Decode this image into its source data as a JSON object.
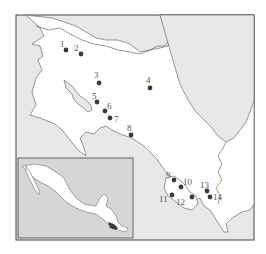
{
  "map": {
    "title": "",
    "region": "Costa Rica",
    "colors": {
      "land": "#ffffff",
      "sea": "#e8e8e8",
      "border": "#555555",
      "frame": "#444444",
      "site_marker": "#3a3a3a",
      "inset_sea": "#d6d6d6",
      "inset_highlight": "#3a3a3a"
    },
    "sites": [
      {
        "label": "1",
        "x": 66,
        "y": 50
      },
      {
        "label": "2",
        "x": 81,
        "y": 54
      },
      {
        "label": "3",
        "x": 99,
        "y": 83
      },
      {
        "label": "4",
        "x": 150,
        "y": 88
      },
      {
        "label": "5",
        "x": 97,
        "y": 102
      },
      {
        "label": "6",
        "x": 105,
        "y": 111
      },
      {
        "label": "7",
        "x": 110,
        "y": 118
      },
      {
        "label": "8",
        "x": 131,
        "y": 135
      },
      {
        "label": "9",
        "x": 174,
        "y": 180
      },
      {
        "label": "10",
        "x": 181,
        "y": 187
      },
      {
        "label": "11",
        "x": 172,
        "y": 195
      },
      {
        "label": "12",
        "x": 192,
        "y": 197
      },
      {
        "label": "13",
        "x": 207,
        "y": 191
      },
      {
        "label": "14",
        "x": 210,
        "y": 197
      }
    ],
    "inset": {
      "description": "Mexico and Central America locator map",
      "highlight": "Costa Rica"
    }
  }
}
